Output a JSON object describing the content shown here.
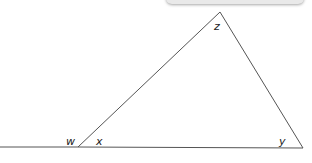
{
  "diagram": {
    "type": "triangle-exterior-angle",
    "labels": {
      "w": "w",
      "x": "x",
      "y": "y",
      "z": "z"
    },
    "stroke_color": "#555555"
  }
}
